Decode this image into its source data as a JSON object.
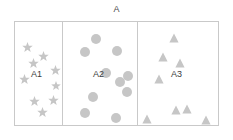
{
  "figure": {
    "title": "A",
    "width": 233,
    "height": 140,
    "background_color": "#ffffff",
    "border_color": "#c9c9c9",
    "marker_color": "#c6c6c6",
    "label_color": "#3c3c3c"
  },
  "chart_data": {
    "type": "scatter",
    "title": "A",
    "subtitle": "",
    "xlabel": "",
    "ylabel": "",
    "grid": false,
    "legend": "none",
    "axis_visible": false,
    "bounding_box": {
      "x": 14,
      "y": 21,
      "width": 205,
      "height": 105
    },
    "dividers_x": [
      62,
      137
    ],
    "series": [
      {
        "name": "A1",
        "marker": "star",
        "color": "#c6c6c6",
        "count": 9,
        "label": {
          "text": "A1",
          "x": 31,
          "y": 74
        },
        "panel": {
          "x": 14,
          "y": 21,
          "width": 48,
          "height": 105
        },
        "points": [
          {
            "x": 27,
            "y": 47,
            "size": 11
          },
          {
            "x": 43,
            "y": 56,
            "size": 11
          },
          {
            "x": 33,
            "y": 63,
            "size": 11
          },
          {
            "x": 55,
            "y": 70,
            "size": 11
          },
          {
            "x": 24,
            "y": 79,
            "size": 11
          },
          {
            "x": 34,
            "y": 101,
            "size": 11
          },
          {
            "x": 53,
            "y": 100,
            "size": 11
          },
          {
            "x": 42,
            "y": 112,
            "size": 11
          },
          {
            "x": 56,
            "y": 86,
            "size": 10
          }
        ]
      },
      {
        "name": "A2",
        "marker": "circle",
        "color": "#c6c6c6",
        "count": 10,
        "label": {
          "text": "A2",
          "x": 93,
          "y": 74
        },
        "panel": {
          "x": 62,
          "y": 21,
          "width": 75,
          "height": 105
        },
        "points": [
          {
            "x": 96,
            "y": 39,
            "size": 10
          },
          {
            "x": 85,
            "y": 52,
            "size": 10
          },
          {
            "x": 117,
            "y": 51,
            "size": 10
          },
          {
            "x": 106,
            "y": 73,
            "size": 10
          },
          {
            "x": 128,
            "y": 76,
            "size": 10
          },
          {
            "x": 120,
            "y": 82,
            "size": 10
          },
          {
            "x": 127,
            "y": 92,
            "size": 10
          },
          {
            "x": 93,
            "y": 97,
            "size": 10
          },
          {
            "x": 85,
            "y": 113,
            "size": 10
          },
          {
            "x": 116,
            "y": 118,
            "size": 10
          }
        ]
      },
      {
        "name": "A3",
        "marker": "triangle",
        "color": "#c6c6c6",
        "count": 8,
        "label": {
          "text": "A3",
          "x": 171,
          "y": 74
        },
        "panel": {
          "x": 137,
          "y": 21,
          "width": 82,
          "height": 105
        },
        "points": [
          {
            "x": 174,
            "y": 38,
            "size": 10
          },
          {
            "x": 163,
            "y": 57,
            "size": 10
          },
          {
            "x": 180,
            "y": 63,
            "size": 10
          },
          {
            "x": 159,
            "y": 79,
            "size": 10
          },
          {
            "x": 176,
            "y": 110,
            "size": 10
          },
          {
            "x": 187,
            "y": 109,
            "size": 10
          },
          {
            "x": 147,
            "y": 119,
            "size": 10
          },
          {
            "x": 206,
            "y": 120,
            "size": 10
          }
        ]
      }
    ]
  }
}
